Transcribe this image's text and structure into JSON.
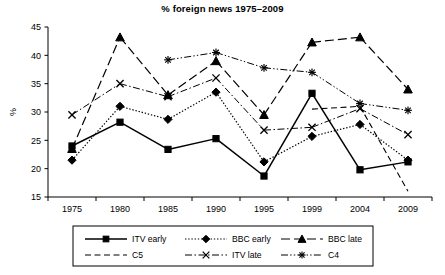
{
  "chart_data": {
    "type": "line",
    "title": "% foreign news 1975–2009",
    "xlabel": "",
    "ylabel": "%",
    "categories": [
      "1975",
      "1980",
      "1985",
      "1990",
      "1995",
      "1999",
      "2004",
      "2009"
    ],
    "ylim": [
      15,
      45
    ],
    "yticks": [
      15,
      20,
      25,
      30,
      35,
      40,
      45
    ],
    "grid": false,
    "legend_position": "bottom",
    "series": [
      {
        "name": "ITV early",
        "marker": "square",
        "dash": "solid",
        "values": [
          24.0,
          28.2,
          23.4,
          25.3,
          18.7,
          33.3,
          19.8,
          21.2
        ]
      },
      {
        "name": "BBC early",
        "marker": "diamond",
        "dash": "dotted",
        "values": [
          21.5,
          31.0,
          28.7,
          33.5,
          21.2,
          25.7,
          27.8,
          21.5
        ]
      },
      {
        "name": "BBC late",
        "marker": "triangle",
        "dash": "dash-dot-long",
        "values": [
          23.5,
          43.2,
          33.0,
          39.0,
          29.5,
          42.3,
          43.2,
          34.0
        ]
      },
      {
        "name": "C5",
        "marker": "none",
        "dash": "dashed",
        "values": [
          null,
          null,
          null,
          null,
          null,
          30.5,
          31.0,
          16.0
        ]
      },
      {
        "name": "ITV late",
        "marker": "cross",
        "dash": "dash-dot",
        "values": [
          29.5,
          35.0,
          32.7,
          36.0,
          26.8,
          27.3,
          30.6,
          26.0
        ]
      },
      {
        "name": "C4",
        "marker": "asterisk",
        "dash": "dash-dot-dot",
        "values": [
          null,
          null,
          39.2,
          40.5,
          37.8,
          37.0,
          31.5,
          30.3
        ]
      }
    ]
  }
}
